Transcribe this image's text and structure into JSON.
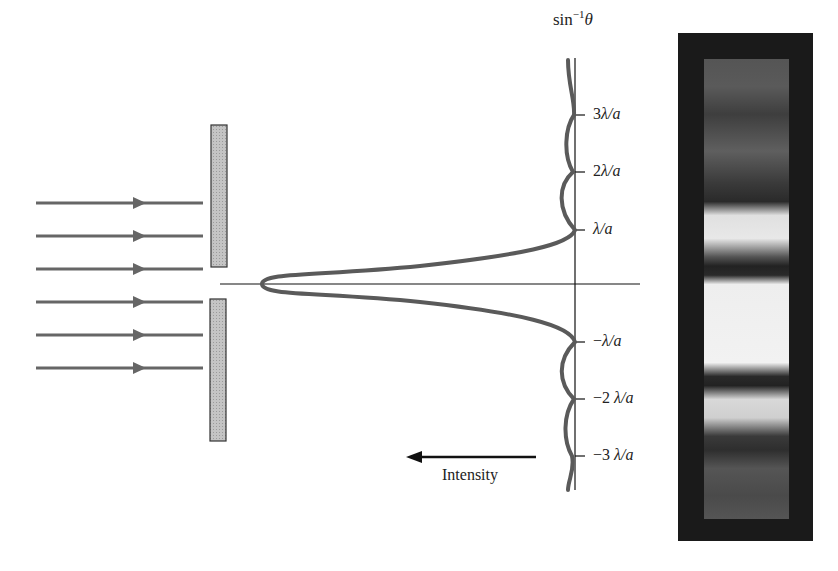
{
  "diagram": {
    "axis_title": "sin⁻¹θ",
    "axis_title_parts": {
      "base": "sin",
      "sup": "−1",
      "var": "θ"
    },
    "tick_labels": [
      {
        "id": "plus3",
        "num": "3",
        "text": "λ/a"
      },
      {
        "id": "plus2",
        "num": "2",
        "text": "λ/a"
      },
      {
        "id": "plus1",
        "num": "",
        "text": "λ/a"
      },
      {
        "id": "minus1",
        "num": "−",
        "text": "λ/a"
      },
      {
        "id": "minus2",
        "num": "−2 ",
        "text": "λ/a"
      },
      {
        "id": "minus3",
        "num": "−3 ",
        "text": "λ/a"
      }
    ],
    "intensity_label": "Intensity",
    "incoming_rays": 6,
    "colors": {
      "curve": "#5a5a5a",
      "barrier": "#bdbdbd",
      "ray": "#666666",
      "line": "#111111",
      "photo_bg": "#1a1a1a"
    }
  }
}
